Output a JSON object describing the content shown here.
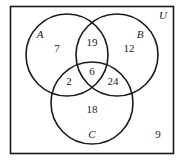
{
  "diagram": {
    "type": "venn-3",
    "universe_label": "U",
    "sets": [
      {
        "name": "A",
        "cx": 67,
        "cy": 55,
        "r": 41,
        "label_x": 40,
        "label_y": 38
      },
      {
        "name": "B",
        "cx": 117,
        "cy": 55,
        "r": 41,
        "label_x": 140,
        "label_y": 38
      },
      {
        "name": "C",
        "cx": 92,
        "cy": 103,
        "r": 41,
        "label_x": 92,
        "label_y": 138
      }
    ],
    "regions": [
      {
        "id": "A-only",
        "value": "7",
        "x": 57,
        "y": 52
      },
      {
        "id": "A-and-B-only",
        "value": "19",
        "x": 92,
        "y": 46
      },
      {
        "id": "B-only",
        "value": "12",
        "x": 129,
        "y": 52
      },
      {
        "id": "A-B-C",
        "value": "6",
        "x": 92,
        "y": 75
      },
      {
        "id": "A-and-C-only",
        "value": "2",
        "x": 69,
        "y": 85
      },
      {
        "id": "B-and-C-only",
        "value": "24",
        "x": 113,
        "y": 85
      },
      {
        "id": "C-only",
        "value": "18",
        "x": 92,
        "y": 113
      },
      {
        "id": "outside",
        "value": "9",
        "x": 158,
        "y": 138
      }
    ]
  }
}
